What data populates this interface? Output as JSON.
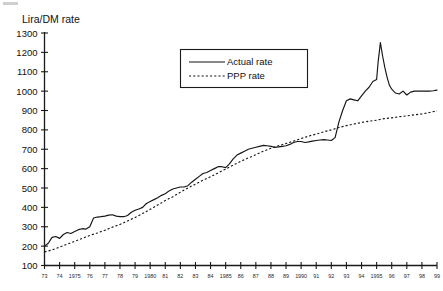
{
  "chart_data": {
    "type": "line",
    "title": "",
    "ylabel": "Lira/DM rate",
    "xlabel": "",
    "ylim": [
      100,
      1300
    ],
    "ytick_step": 100,
    "yticks": [
      100,
      200,
      300,
      400,
      500,
      600,
      700,
      800,
      900,
      1000,
      1100,
      1200,
      1300
    ],
    "xlim": [
      1973,
      1999
    ],
    "xticks": [
      1973,
      1974,
      1975,
      1976,
      1977,
      1978,
      1979,
      1980,
      1981,
      1982,
      1983,
      1984,
      1985,
      1986,
      1987,
      1988,
      1989,
      1990,
      1991,
      1992,
      1993,
      1994,
      1995,
      1996,
      1997,
      1998,
      1999
    ],
    "xtick_labels": [
      "73",
      "74",
      "1975",
      "76",
      "77",
      "78",
      "79",
      "1980",
      "81",
      "82",
      "83",
      "84",
      "1985",
      "86",
      "87",
      "88",
      "89",
      "1990",
      "91",
      "92",
      "93",
      "94",
      "1995",
      "96",
      "97",
      "98",
      "99"
    ],
    "grid": false,
    "legend_position": "top-center",
    "series": [
      {
        "name": "Actual rate",
        "style": "solid",
        "x": [
          1973.0,
          1973.25,
          1973.5,
          1973.75,
          1974.0,
          1974.25,
          1974.5,
          1974.75,
          1975.0,
          1975.25,
          1975.5,
          1975.75,
          1976.0,
          1976.25,
          1976.5,
          1976.75,
          1977.0,
          1977.25,
          1977.5,
          1977.75,
          1978.0,
          1978.25,
          1978.5,
          1978.75,
          1979.0,
          1979.25,
          1979.5,
          1979.75,
          1980.0,
          1980.25,
          1980.5,
          1980.75,
          1981.0,
          1981.25,
          1981.5,
          1981.75,
          1982.0,
          1982.25,
          1982.5,
          1982.75,
          1983.0,
          1983.25,
          1983.5,
          1983.75,
          1984.0,
          1984.25,
          1984.5,
          1984.75,
          1985.0,
          1985.25,
          1985.5,
          1985.75,
          1986.0,
          1986.25,
          1986.5,
          1986.75,
          1987.0,
          1987.25,
          1987.5,
          1987.75,
          1988.0,
          1988.25,
          1988.5,
          1988.75,
          1989.0,
          1989.25,
          1989.5,
          1989.75,
          1990.0,
          1990.25,
          1990.5,
          1990.75,
          1991.0,
          1991.25,
          1991.5,
          1991.75,
          1992.0,
          1992.25,
          1992.5,
          1992.75,
          1993.0,
          1993.25,
          1993.5,
          1993.75,
          1994.0,
          1994.25,
          1994.5,
          1994.75,
          1995.0,
          1995.1,
          1995.25,
          1995.4,
          1995.55,
          1995.7,
          1995.85,
          1996.0,
          1996.25,
          1996.5,
          1996.75,
          1997.0,
          1997.25,
          1997.5,
          1997.75,
          1998.0,
          1998.25,
          1998.5,
          1998.75,
          1999.0
        ],
        "y": [
          200,
          215,
          245,
          250,
          240,
          260,
          270,
          265,
          275,
          285,
          290,
          288,
          300,
          345,
          350,
          352,
          355,
          360,
          362,
          355,
          352,
          352,
          358,
          375,
          385,
          392,
          400,
          420,
          430,
          440,
          450,
          462,
          470,
          485,
          495,
          500,
          505,
          505,
          512,
          530,
          545,
          560,
          575,
          580,
          590,
          600,
          610,
          610,
          605,
          625,
          650,
          670,
          680,
          690,
          700,
          705,
          710,
          715,
          720,
          718,
          715,
          710,
          712,
          715,
          718,
          725,
          735,
          740,
          740,
          735,
          738,
          742,
          745,
          748,
          750,
          748,
          745,
          760,
          840,
          900,
          950,
          960,
          955,
          950,
          975,
          1000,
          1020,
          1050,
          1060,
          1150,
          1250,
          1180,
          1120,
          1070,
          1030,
          1010,
          990,
          985,
          1000,
          980,
          995,
          1000,
          1000,
          1000,
          1000,
          1000,
          1002,
          1005
        ]
      },
      {
        "name": "PPP rate",
        "style": "dashed",
        "x": [
          1973.0,
          1973.5,
          1974.0,
          1974.5,
          1975.0,
          1975.5,
          1976.0,
          1976.5,
          1977.0,
          1977.5,
          1978.0,
          1978.5,
          1979.0,
          1979.5,
          1980.0,
          1980.5,
          1981.0,
          1981.5,
          1982.0,
          1982.5,
          1983.0,
          1983.5,
          1984.0,
          1984.5,
          1985.0,
          1985.5,
          1986.0,
          1986.5,
          1987.0,
          1987.5,
          1988.0,
          1988.5,
          1989.0,
          1989.5,
          1990.0,
          1990.5,
          1991.0,
          1991.5,
          1992.0,
          1992.5,
          1993.0,
          1993.5,
          1994.0,
          1994.5,
          1995.0,
          1995.5,
          1996.0,
          1996.5,
          1997.0,
          1997.5,
          1998.0,
          1998.5,
          1999.0
        ],
        "y": [
          170,
          180,
          195,
          210,
          225,
          240,
          255,
          268,
          282,
          298,
          312,
          330,
          348,
          368,
          390,
          412,
          435,
          455,
          478,
          500,
          520,
          540,
          558,
          578,
          598,
          618,
          638,
          655,
          672,
          690,
          705,
          718,
          730,
          742,
          755,
          768,
          778,
          790,
          800,
          812,
          822,
          830,
          838,
          845,
          850,
          858,
          862,
          868,
          872,
          878,
          882,
          890,
          898
        ]
      }
    ]
  },
  "legend": {
    "entries": [
      {
        "label": "Actual rate",
        "style": "solid"
      },
      {
        "label": "PPP rate",
        "style": "dashed"
      }
    ]
  }
}
